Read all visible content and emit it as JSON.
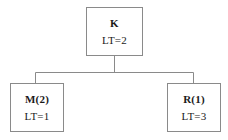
{
  "diagram": {
    "type": "tree",
    "background_color": "#ffffff",
    "line_color": "#8a8a8a",
    "text_color": "#1a1a1a",
    "nodes": [
      {
        "id": "root",
        "label": "K",
        "value": "LT=2",
        "role": "parent"
      },
      {
        "id": "left",
        "label": "M(2)",
        "value": "LT=1",
        "role": "child"
      },
      {
        "id": "right",
        "label": "R(1)",
        "value": "LT=3",
        "role": "child"
      }
    ],
    "edges": [
      {
        "from": "root",
        "to": "left"
      },
      {
        "from": "root",
        "to": "right"
      }
    ]
  }
}
